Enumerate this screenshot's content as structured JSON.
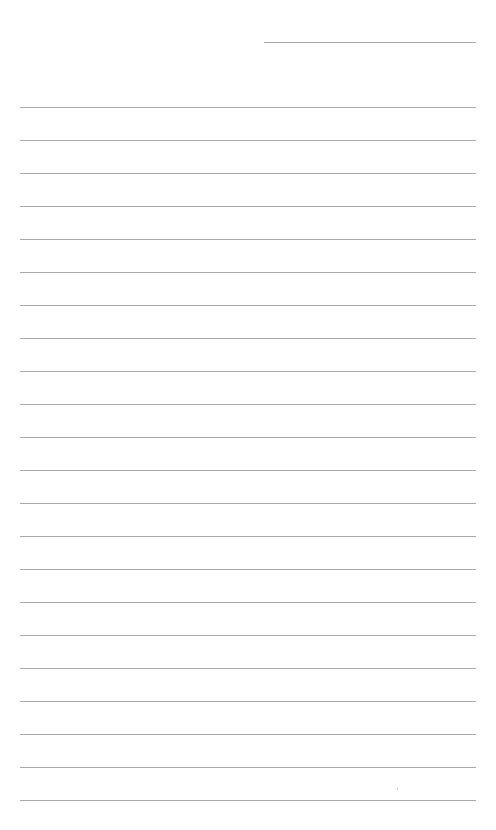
{
  "page": {
    "type": "blank lined writing sheet",
    "header_line": {
      "label": ""
    },
    "lines": [
      {
        "text": ""
      },
      {
        "text": ""
      },
      {
        "text": ""
      },
      {
        "text": ""
      },
      {
        "text": ""
      },
      {
        "text": ""
      },
      {
        "text": ""
      },
      {
        "text": ""
      },
      {
        "text": ""
      },
      {
        "text": ""
      },
      {
        "text": ""
      },
      {
        "text": ""
      },
      {
        "text": ""
      },
      {
        "text": ""
      },
      {
        "text": ""
      },
      {
        "text": ""
      },
      {
        "text": ""
      },
      {
        "text": ""
      },
      {
        "text": ""
      },
      {
        "text": ""
      },
      {
        "text": ""
      },
      {
        "text": ""
      }
    ],
    "line_color": "#a8a8a8",
    "background_color": "#ffffff"
  }
}
